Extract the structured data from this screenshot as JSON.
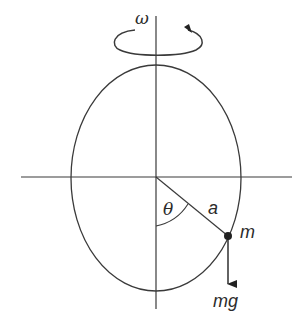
{
  "diagram": {
    "labels": {
      "omega": "ω",
      "theta": "θ",
      "a": "a",
      "m": "m",
      "mg": "mg"
    },
    "colors": {
      "stroke": "#3a3a3a",
      "text": "#2b2b2b",
      "background": "#ffffff"
    }
  }
}
